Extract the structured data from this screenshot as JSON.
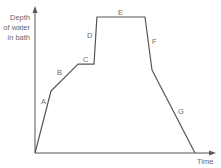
{
  "chart_data": {
    "type": "line",
    "title": "",
    "xlabel": "Time",
    "ylabel": "Depth of water in bath",
    "ylabel_lines": [
      "Depth",
      "of water",
      "in bath"
    ],
    "axis_ticks": "none",
    "grid": false,
    "legend": "none",
    "xlim": [
      0,
      100
    ],
    "ylim": [
      0,
      105
    ],
    "series": [
      {
        "name": "Depth of water",
        "color": "#555555",
        "points": [
          {
            "t": 0,
            "d": 0
          },
          {
            "t": 8.9,
            "d": 45.6
          },
          {
            "t": 23.9,
            "d": 65.4
          },
          {
            "t": 32.8,
            "d": 65.4
          },
          {
            "t": 34.4,
            "d": 100
          },
          {
            "t": 61.1,
            "d": 100
          },
          {
            "t": 65.0,
            "d": 61.0
          },
          {
            "t": 88.9,
            "d": 0
          }
        ]
      }
    ],
    "segment_labels": [
      {
        "label": "A",
        "x": 41,
        "y": 104
      },
      {
        "label": "B",
        "x": 57,
        "y": 75
      },
      {
        "label": "C",
        "x": 83,
        "y": 62
      },
      {
        "label": "D",
        "x": 87,
        "y": 38
      },
      {
        "label": "E",
        "x": 118,
        "y": 15
      },
      {
        "label": "F",
        "x": 152,
        "y": 44
      },
      {
        "label": "G",
        "x": 178,
        "y": 114
      }
    ]
  },
  "layout": {
    "origin_px": [
      35,
      153
    ],
    "x_end_px": 216,
    "y_end_px": 6,
    "x_scale": 1.8,
    "y_scale": 1.36,
    "axis_color": "#555555"
  }
}
